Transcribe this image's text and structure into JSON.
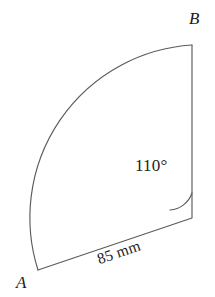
{
  "figure": {
    "type": "circular-sector",
    "background_color": "#ffffff",
    "stroke_color": "#5b5b5b",
    "text_color": "#1c1c1c",
    "vertices": {
      "A": {
        "label": "A",
        "x": 38,
        "y": 270
      },
      "B": {
        "label": "B",
        "x": 192,
        "y": 45
      },
      "centre": {
        "label": "",
        "x": 192,
        "y": 218
      }
    },
    "labels": {
      "vertex_a": "A",
      "vertex_b": "B",
      "angle": "110°",
      "side": "85 mm"
    },
    "measurements": {
      "angle_value": 110,
      "angle_unit": "degrees",
      "angle_text": "110°",
      "radius_value": 85,
      "radius_unit": "mm",
      "radius_text": "85 mm"
    },
    "geometry": {
      "radius_px": 173,
      "start_angle_deg": -90,
      "sweep_deg": 110,
      "angle_marker_radius_px": 25,
      "side_label_rotation_deg": -18.7
    },
    "paths": {
      "sector_outline": "M 192 45 L 192 218 L 38 270",
      "arc": "M 38 270 A 173 173 0 0 1 192 45",
      "angle_marker": "M 192 193 A 25 25 0 0 1 170 210"
    }
  }
}
